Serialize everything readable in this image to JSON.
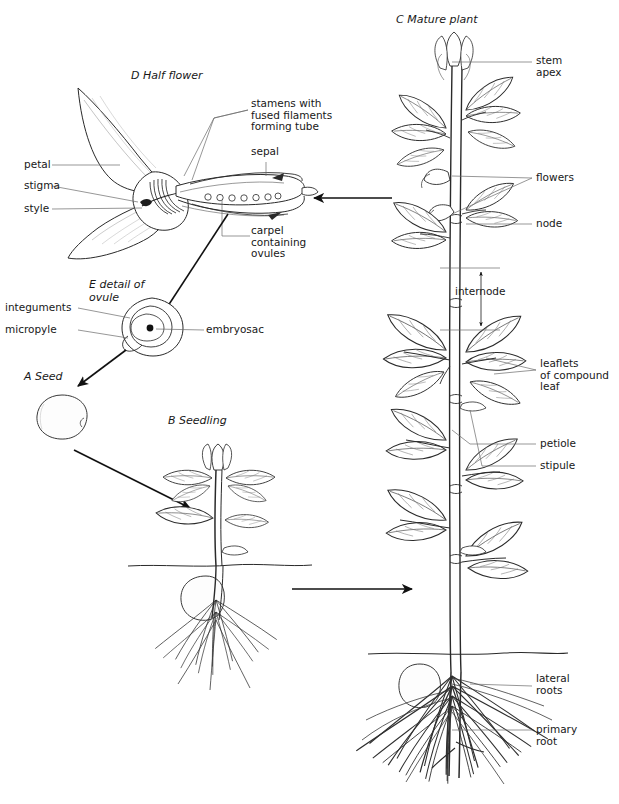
{
  "figure": {
    "background": "#ffffff",
    "ink": "#1a1a1a"
  },
  "panels": [
    {
      "id": "A",
      "title": "A  Seed"
    },
    {
      "id": "B",
      "title": "B  Seedling"
    },
    {
      "id": "C",
      "title": "C  Mature plant"
    },
    {
      "id": "D",
      "title": "D  Half flower"
    },
    {
      "id": "E",
      "title": "E  detail of\novule"
    }
  ],
  "labels": {
    "flower": {
      "petal": "petal",
      "stigma": "stigma",
      "style": "style",
      "stamens": "stamens with\nfused filaments\nforming tube",
      "sepal": "sepal",
      "carpel": "carpel\ncontaining\novules"
    },
    "ovule": {
      "integuments": "integuments",
      "micropyle": "micropyle",
      "embryosac": "embryosac"
    },
    "mature_plant": {
      "stem_apex": "stem\napex",
      "flowers": "flowers",
      "node": "node",
      "internode": "internode",
      "leaflets": "leaflets\nof compound\nleaf",
      "petiole": "petiole",
      "stipule": "stipule",
      "lateral_roots": "lateral\nroots",
      "primary_root": "primary\nroot"
    }
  },
  "arrows": [
    {
      "name": "mature-plant-to-half-flower",
      "direction": "left"
    },
    {
      "name": "half-flower-to-ovule-detail",
      "direction": "down-left"
    },
    {
      "name": "ovule-to-seed",
      "direction": "down-left"
    },
    {
      "name": "seed-to-seedling",
      "direction": "down-right"
    },
    {
      "name": "seedling-to-mature-plant",
      "direction": "right"
    }
  ]
}
